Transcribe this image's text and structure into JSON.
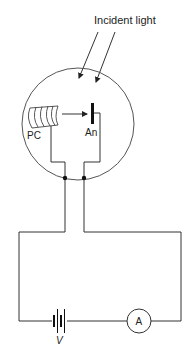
{
  "diagram": {
    "labels": {
      "incident_light": "Incident light",
      "photocathode": "PC",
      "anode": "An",
      "voltage": "V",
      "ammeter": "A"
    },
    "components": [
      {
        "id": "vacuum-tube",
        "type": "circle"
      },
      {
        "id": "photocathode",
        "type": "curved-plate",
        "label": "PC"
      },
      {
        "id": "anode",
        "type": "plate",
        "label": "An"
      },
      {
        "id": "battery",
        "type": "cell",
        "label": "V"
      },
      {
        "id": "ammeter",
        "type": "meter",
        "label": "A"
      }
    ],
    "colors": {
      "line": "#333333",
      "background": "#ffffff"
    }
  }
}
